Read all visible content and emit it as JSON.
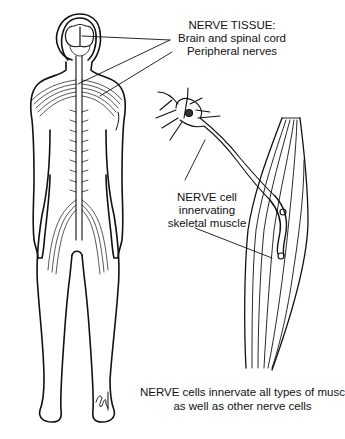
{
  "diagram": {
    "labels": {
      "nerve_tissue_title": "NERVE TISSUE:",
      "brain_spinal_cord": "Brain and spinal cord",
      "peripheral_nerves": "Peripheral nerves",
      "nerve_cell_line1": "NERVE cell",
      "nerve_cell_line2": "innervating",
      "nerve_cell_line3": "skeletal muscle",
      "footnote_line1": "NERVE cells innervate all types of muscle,",
      "footnote_line2": "as well as other nerve cells"
    },
    "figures": [
      "human-body-nervous-system",
      "neuron",
      "skeletal-muscle"
    ],
    "signature": "artist-signature"
  }
}
